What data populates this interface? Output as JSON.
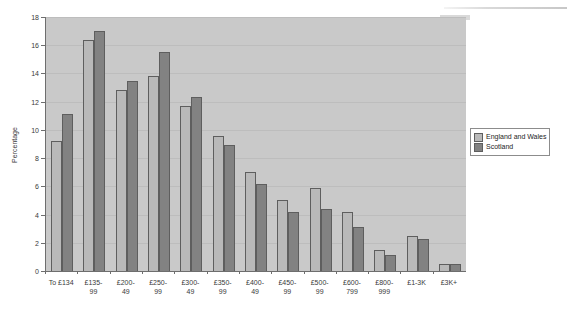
{
  "chart_data": {
    "type": "bar",
    "title": "",
    "xlabel": "",
    "ylabel": "Percentage",
    "ylim": [
      0,
      18
    ],
    "y_ticks": [
      0,
      2,
      4,
      6,
      8,
      10,
      12,
      14,
      16,
      18
    ],
    "grid": true,
    "legend_position": "right",
    "categories": [
      "To £134",
      "£135-\n99",
      "£200-\n49",
      "£250-\n99",
      "£300-\n49",
      "£350-\n99",
      "£400-\n49",
      "£450-\n99",
      "£500-\n99",
      "£600-\n799",
      "£800-\n999",
      "£1-3K",
      "£3K+"
    ],
    "series": [
      {
        "name": "England and Wales",
        "color": "#b9b9b9",
        "values": [
          9.2,
          16.4,
          12.8,
          13.8,
          11.7,
          9.6,
          7.0,
          5.0,
          5.85,
          4.2,
          1.5,
          2.5,
          0.5
        ]
      },
      {
        "name": "Scotland",
        "color": "#828282",
        "values": [
          11.1,
          17.0,
          13.5,
          15.5,
          12.3,
          8.9,
          6.15,
          4.2,
          4.4,
          3.1,
          1.1,
          2.3,
          0.5
        ]
      }
    ]
  }
}
